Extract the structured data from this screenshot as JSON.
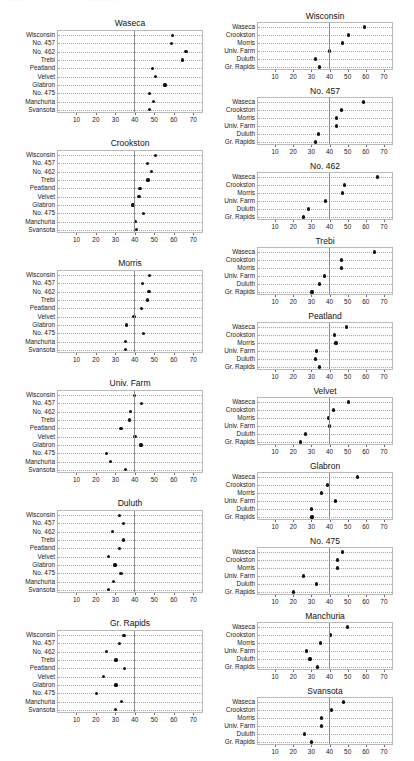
{
  "ghost_header": {
    "fragments": [
      "···  ···",
      "·····  ··  ···"
    ]
  },
  "axis": {
    "ticks": [
      10,
      20,
      30,
      40,
      50,
      60,
      70
    ],
    "tick_labels": [
      "10",
      "20",
      "30",
      "40",
      "50",
      "60",
      "70"
    ],
    "xmin": 0,
    "xmax": 75,
    "reference_line": 39,
    "grid": "horizontal-dotted"
  },
  "sites": [
    "Waseca",
    "Crookston",
    "Morris",
    "Univ. Farm",
    "Duluth",
    "Gr. Rapids"
  ],
  "varieties": [
    "Wisconsin",
    "No. 457",
    "No. 462",
    "Trebi",
    "Peatland",
    "Velvet",
    "Glabron",
    "No. 475",
    "Manchuria",
    "Svansota"
  ],
  "chart_data": [
    {
      "type": "scatter",
      "title": "Waseca",
      "xlabel": "",
      "ylabel": "",
      "xlim": [
        0,
        75
      ],
      "grid": true,
      "categories": [
        "Wisconsin",
        "No. 457",
        "No. 462",
        "Trebi",
        "Peatland",
        "Velvet",
        "Glabron",
        "No. 475",
        "Manchuria",
        "Svansota"
      ],
      "values": [
        58.8,
        58.1,
        65.8,
        64.1,
        48.6,
        50.0,
        55.0,
        46.8,
        49.2,
        47.0
      ]
    },
    {
      "type": "scatter",
      "title": "Crookston",
      "xlabel": "",
      "ylabel": "",
      "xlim": [
        0,
        75
      ],
      "grid": true,
      "categories": [
        "Wisconsin",
        "No. 457",
        "No. 462",
        "Trebi",
        "Peatland",
        "Velvet",
        "Glabron",
        "No. 475",
        "Manchuria",
        "Svansota"
      ],
      "values": [
        49.9,
        46.0,
        47.9,
        46.2,
        42.1,
        41.6,
        38.5,
        43.8,
        39.9,
        40.5
      ]
    },
    {
      "type": "scatter",
      "title": "Morris",
      "xlabel": "",
      "ylabel": "",
      "xlim": [
        0,
        75
      ],
      "grid": true,
      "categories": [
        "Wisconsin",
        "No. 457",
        "No. 462",
        "Trebi",
        "Peatland",
        "Velvet",
        "Glabron",
        "No. 475",
        "Manchuria",
        "Svansota"
      ],
      "values": [
        46.8,
        43.5,
        46.7,
        46.0,
        43.0,
        39.0,
        35.1,
        43.9,
        34.6,
        34.8
      ]
    },
    {
      "type": "scatter",
      "title": "Univ. Farm",
      "xlabel": "",
      "ylabel": "",
      "xlim": [
        0,
        75
      ],
      "grid": true,
      "categories": [
        "Wisconsin",
        "No. 457",
        "No. 462",
        "Trebi",
        "Peatland",
        "Velvet",
        "Glabron",
        "No. 475",
        "Manchuria",
        "Svansota"
      ],
      "values": [
        39.3,
        43.1,
        37.2,
        36.6,
        32.4,
        39.6,
        42.6,
        25.0,
        26.9,
        34.8
      ]
    },
    {
      "type": "scatter",
      "title": "Duluth",
      "xlabel": "",
      "ylabel": "",
      "xlim": [
        0,
        75
      ],
      "grid": true,
      "categories": [
        "Wisconsin",
        "No. 457",
        "No. 462",
        "Trebi",
        "Peatland",
        "Velvet",
        "Glabron",
        "No. 475",
        "Manchuria",
        "Svansota"
      ],
      "values": [
        31.6,
        33.5,
        28.0,
        33.7,
        31.8,
        26.1,
        29.3,
        32.4,
        28.7,
        25.8
      ]
    },
    {
      "type": "scatter",
      "title": "Gr. Rapids",
      "xlabel": "",
      "ylabel": "",
      "xlim": [
        0,
        75
      ],
      "grid": true,
      "categories": [
        "Wisconsin",
        "No. 457",
        "No. 462",
        "Trebi",
        "Peatland",
        "Velvet",
        "Glabron",
        "No. 475",
        "Manchuria",
        "Svansota"
      ],
      "values": [
        33.9,
        31.7,
        24.9,
        29.8,
        34.0,
        23.4,
        29.8,
        19.7,
        32.8,
        29.6
      ]
    },
    {
      "type": "scatter",
      "title": "Wisconsin",
      "xlabel": "",
      "ylabel": "",
      "xlim": [
        0,
        75
      ],
      "grid": true,
      "categories": [
        "Waseca",
        "Crookston",
        "Morris",
        "Univ. Farm",
        "Duluth",
        "Gr. Rapids"
      ],
      "values": [
        58.8,
        49.9,
        46.8,
        39.3,
        31.6,
        33.9
      ]
    },
    {
      "type": "scatter",
      "title": "No. 457",
      "xlabel": "",
      "ylabel": "",
      "xlim": [
        0,
        75
      ],
      "grid": true,
      "categories": [
        "Waseca",
        "Crookston",
        "Morris",
        "Univ. Farm",
        "Duluth",
        "Gr. Rapids"
      ],
      "values": [
        58.1,
        46.0,
        43.5,
        43.1,
        33.5,
        31.7
      ]
    },
    {
      "type": "scatter",
      "title": "No. 462",
      "xlabel": "",
      "ylabel": "",
      "xlim": [
        0,
        75
      ],
      "grid": true,
      "categories": [
        "Waseca",
        "Crookston",
        "Morris",
        "Univ. Farm",
        "Duluth",
        "Gr. Rapids"
      ],
      "values": [
        65.8,
        47.9,
        46.7,
        37.2,
        28.0,
        24.9
      ]
    },
    {
      "type": "scatter",
      "title": "Trebi",
      "xlabel": "",
      "ylabel": "",
      "xlim": [
        0,
        75
      ],
      "grid": true,
      "categories": [
        "Waseca",
        "Crookston",
        "Morris",
        "Univ. Farm",
        "Duluth",
        "Gr. Rapids"
      ],
      "values": [
        64.1,
        46.2,
        46.0,
        36.6,
        33.7,
        29.8
      ]
    },
    {
      "type": "scatter",
      "title": "Peatland",
      "xlabel": "",
      "ylabel": "",
      "xlim": [
        0,
        75
      ],
      "grid": true,
      "categories": [
        "Waseca",
        "Crookston",
        "Morris",
        "Univ. Farm",
        "Duluth",
        "Gr. Rapids"
      ],
      "values": [
        48.6,
        42.1,
        43.0,
        32.4,
        31.8,
        34.0
      ]
    },
    {
      "type": "scatter",
      "title": "Velvet",
      "xlabel": "",
      "ylabel": "",
      "xlim": [
        0,
        75
      ],
      "grid": true,
      "categories": [
        "Waseca",
        "Crookston",
        "Morris",
        "Univ. Farm",
        "Duluth",
        "Gr. Rapids"
      ],
      "values": [
        50.0,
        41.6,
        39.0,
        39.6,
        26.1,
        23.4
      ]
    },
    {
      "type": "scatter",
      "title": "Glabron",
      "xlabel": "",
      "ylabel": "",
      "xlim": [
        0,
        75
      ],
      "grid": true,
      "categories": [
        "Waseca",
        "Crookston",
        "Morris",
        "Univ. Farm",
        "Duluth",
        "Gr. Rapids"
      ],
      "values": [
        55.0,
        38.5,
        35.1,
        42.6,
        29.3,
        29.8
      ]
    },
    {
      "type": "scatter",
      "title": "No. 475",
      "xlabel": "",
      "ylabel": "",
      "xlim": [
        0,
        75
      ],
      "grid": true,
      "categories": [
        "Waseca",
        "Crookston",
        "Morris",
        "Univ. Farm",
        "Duluth",
        "Gr. Rapids"
      ],
      "values": [
        46.8,
        43.8,
        43.9,
        25.0,
        32.4,
        19.7
      ]
    },
    {
      "type": "scatter",
      "title": "Manchuria",
      "xlabel": "",
      "ylabel": "",
      "xlim": [
        0,
        75
      ],
      "grid": true,
      "categories": [
        "Waseca",
        "Crookston",
        "Morris",
        "Univ. Farm",
        "Duluth",
        "Gr. Rapids"
      ],
      "values": [
        49.2,
        39.9,
        34.6,
        26.9,
        28.7,
        32.8
      ]
    },
    {
      "type": "scatter",
      "title": "Svansota",
      "xlabel": "",
      "ylabel": "",
      "xlim": [
        0,
        75
      ],
      "grid": true,
      "categories": [
        "Waseca",
        "Crookston",
        "Morris",
        "Univ. Farm",
        "Duluth",
        "Gr. Rapids"
      ],
      "values": [
        47.0,
        40.5,
        34.8,
        34.8,
        25.8,
        29.6
      ]
    }
  ],
  "layout": {
    "left_column_panel_indices": [
      0,
      1,
      2,
      3,
      4,
      5
    ],
    "right_column_panel_indices": [
      6,
      7,
      8,
      9,
      10,
      11,
      12,
      13,
      14,
      15
    ]
  }
}
